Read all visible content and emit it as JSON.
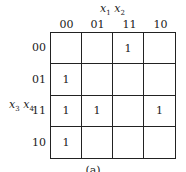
{
  "kmap": {
    "col_var": "x1 x2",
    "row_var": "x3 x4",
    "col_labels": [
      "00",
      "01",
      "11",
      "10"
    ],
    "row_labels": [
      "00",
      "01",
      "11",
      "10"
    ],
    "cells": [
      [
        "",
        "",
        "1",
        ""
      ],
      [
        "1",
        "",
        "",
        ""
      ],
      [
        "1",
        "1",
        "",
        "1"
      ],
      [
        "1",
        "",
        "",
        ""
      ]
    ]
  },
  "caption": "(a)"
}
